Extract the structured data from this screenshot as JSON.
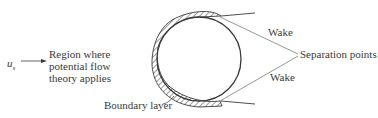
{
  "diagram": {
    "labels": {
      "velocity_symbol": "u",
      "velocity_subscript": "s",
      "region_line1": "Region where",
      "region_line2": "potential flow",
      "region_line3": "theory applies",
      "wake_upper": "Wake",
      "wake_lower": "Wake",
      "separation_points": "Separation points",
      "boundary_layer": "Boundary layer"
    },
    "colors": {
      "line": "#3a3a3a",
      "text": "#3a3a3a",
      "background": "#ffffff"
    }
  }
}
